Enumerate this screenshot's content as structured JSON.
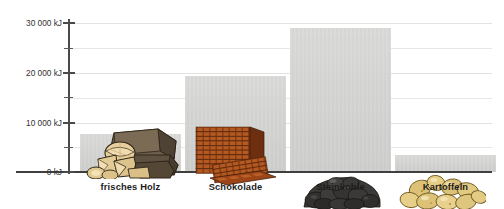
{
  "chart_data": {
    "type": "bar",
    "title": "",
    "subtitle": "",
    "xlabel": "",
    "ylabel": "",
    "unit": "kJ",
    "categories": [
      "frisches Holz",
      "Schokolade",
      "Steinkohle",
      "Kartoffeln"
    ],
    "values": [
      8000,
      20000,
      30000,
      3500
    ],
    "ylim": [
      0,
      31000
    ],
    "ytick_values": [
      0,
      5000,
      10000,
      15000,
      20000,
      25000,
      30000
    ],
    "ytick_labels": [
      "0 kJ",
      "",
      "10 000 kJ",
      "",
      "20 000 kJ",
      "",
      "30 000 kJ"
    ],
    "major_ticks": [
      0,
      10000,
      20000,
      30000
    ],
    "minor_ticks": [
      5000,
      15000,
      25000
    ],
    "grid": true,
    "grid_axis": "y",
    "legend": false,
    "legend_position": "none",
    "bar_color": "#d5d5d3",
    "axis_color": "#3f3f3f",
    "grid_color": "#e7e7e7",
    "label_color": "#1d1d1d",
    "annotations": [
      {
        "category": "frisches Holz",
        "icon": "firewood-logs-illustration"
      },
      {
        "category": "Schokolade",
        "icon": "chocolate-bars-illustration"
      },
      {
        "category": "Steinkohle",
        "icon": "coal-lumps-illustration"
      },
      {
        "category": "Kartoffeln",
        "icon": "potatoes-illustration"
      }
    ]
  },
  "axis": {
    "y_labels": [
      {
        "text": "30 000 kJ",
        "value": 30000
      },
      {
        "text": "20 000 kJ",
        "value": 20000
      },
      {
        "text": "10 000 kJ",
        "value": 10000
      },
      {
        "text": "0 kJ",
        "value": 0
      }
    ]
  },
  "categories": [
    {
      "label": "frisches Holz",
      "value": 8000,
      "icon": "firewood-logs-illustration"
    },
    {
      "label": "Schokolade",
      "value": 20000,
      "icon": "chocolate-bars-illustration"
    },
    {
      "label": "Steinkohle",
      "value": 30000,
      "icon": "coal-lumps-illustration"
    },
    {
      "label": "Kartoffeln",
      "value": 3500,
      "icon": "potatoes-illustration"
    }
  ]
}
